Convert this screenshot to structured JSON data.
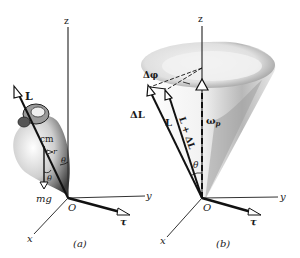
{
  "figure": {
    "panel_a": {
      "caption": "(a)",
      "axes": {
        "z": "z",
        "y": "y",
        "x": "x",
        "origin": "O"
      },
      "labels": {
        "angular_momentum": "L",
        "center_of_mass": "cm",
        "position": "r",
        "angle_1": "θ",
        "angle_2": "θ",
        "weight": "mg",
        "torque": "τ"
      }
    },
    "panel_b": {
      "caption": "(b)",
      "axes": {
        "z": "z",
        "y": "y",
        "x": "x",
        "origin": "O"
      },
      "labels": {
        "delta_phi": "Δφ",
        "delta_L": "ΔL",
        "angular_momentum": "L",
        "new_momentum": "L + ΔL",
        "precession": "ω",
        "precession_sub": "p",
        "angle": "θ",
        "torque": "τ"
      }
    },
    "colors": {
      "ink": "#1a1a1a",
      "shade_dark": "#6e6e6e",
      "shade_light": "#d9d9d9"
    }
  }
}
